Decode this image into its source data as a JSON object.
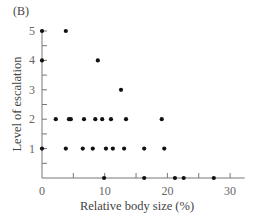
{
  "panel_label": "(B)",
  "chart_data": {
    "type": "scatter",
    "title": "",
    "panel_label": "(B)",
    "xlabel": "Relative body size (%)",
    "ylabel": "Level of escalation",
    "xlim": [
      0,
      32
    ],
    "ylim": [
      0,
      5
    ],
    "x_ticks": [
      0,
      10,
      20,
      30
    ],
    "x_minor_ticks": [
      5,
      15,
      25
    ],
    "y_ticks": [
      1,
      2,
      3,
      4,
      5
    ],
    "y_minor_ticks": [
      0.5,
      1.5,
      2.5,
      3.5,
      4.5
    ],
    "grid": false,
    "legend": null,
    "points": [
      {
        "x": 0.0,
        "y": 5
      },
      {
        "x": 3.8,
        "y": 5
      },
      {
        "x": 0.0,
        "y": 4
      },
      {
        "x": 8.9,
        "y": 4
      },
      {
        "x": 12.6,
        "y": 3
      },
      {
        "x": 2.2,
        "y": 2
      },
      {
        "x": 4.3,
        "y": 2
      },
      {
        "x": 4.6,
        "y": 2
      },
      {
        "x": 6.7,
        "y": 2
      },
      {
        "x": 8.5,
        "y": 2
      },
      {
        "x": 9.6,
        "y": 2
      },
      {
        "x": 11.0,
        "y": 2
      },
      {
        "x": 13.4,
        "y": 2
      },
      {
        "x": 19.1,
        "y": 2
      },
      {
        "x": 0.0,
        "y": 1
      },
      {
        "x": 3.8,
        "y": 1
      },
      {
        "x": 6.5,
        "y": 1
      },
      {
        "x": 8.1,
        "y": 1
      },
      {
        "x": 10.2,
        "y": 1
      },
      {
        "x": 11.3,
        "y": 1
      },
      {
        "x": 13.1,
        "y": 1
      },
      {
        "x": 16.3,
        "y": 1
      },
      {
        "x": 19.5,
        "y": 1
      },
      {
        "x": 9.9,
        "y": 0
      },
      {
        "x": 16.3,
        "y": 0
      },
      {
        "x": 21.2,
        "y": 0
      },
      {
        "x": 22.6,
        "y": 0
      },
      {
        "x": 27.4,
        "y": 0
      }
    ],
    "marker_color": "#111111",
    "axis_color": "#777777"
  }
}
